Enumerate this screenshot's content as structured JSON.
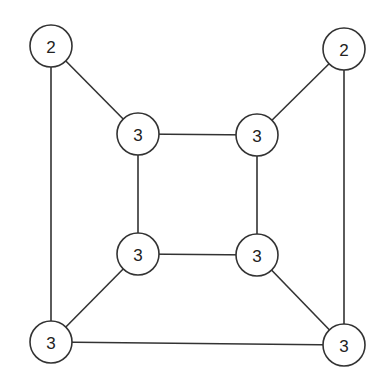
{
  "graph": {
    "nodes": [
      {
        "id": "outer-tl",
        "label": "2",
        "x": 51,
        "y": 46
      },
      {
        "id": "outer-tr",
        "label": "2",
        "x": 344,
        "y": 49
      },
      {
        "id": "inner-tl",
        "label": "3",
        "x": 138,
        "y": 134
      },
      {
        "id": "inner-tr",
        "label": "3",
        "x": 257,
        "y": 135
      },
      {
        "id": "inner-bl",
        "label": "3",
        "x": 138,
        "y": 254
      },
      {
        "id": "inner-br",
        "label": "3",
        "x": 257,
        "y": 255
      },
      {
        "id": "outer-bl",
        "label": "3",
        "x": 51,
        "y": 342
      },
      {
        "id": "outer-br",
        "label": "3",
        "x": 344,
        "y": 345
      }
    ],
    "edges": [
      [
        "outer-tl",
        "inner-tl"
      ],
      [
        "outer-tl",
        "outer-bl"
      ],
      [
        "outer-tr",
        "inner-tr"
      ],
      [
        "outer-tr",
        "outer-br"
      ],
      [
        "inner-tl",
        "inner-tr"
      ],
      [
        "inner-tl",
        "inner-bl"
      ],
      [
        "inner-tr",
        "inner-br"
      ],
      [
        "inner-bl",
        "inner-br"
      ],
      [
        "inner-bl",
        "outer-bl"
      ],
      [
        "inner-br",
        "outer-br"
      ],
      [
        "outer-bl",
        "outer-br"
      ]
    ],
    "node_radius": 21
  }
}
